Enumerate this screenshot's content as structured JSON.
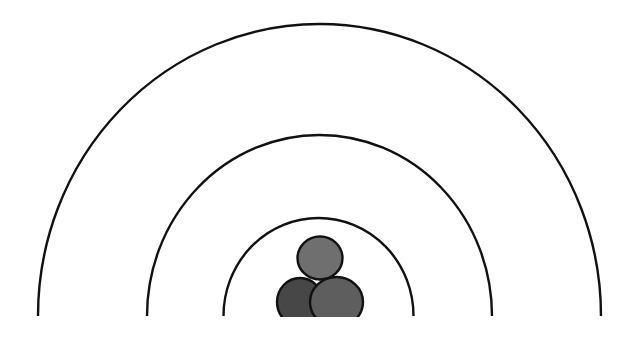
{
  "diagram": {
    "background": "#ffffff",
    "arcs": [
      {
        "name": "inner-arc",
        "cx": 318.5,
        "baseline_y": 316,
        "rx": 95,
        "ry": 98,
        "stroke": "#111111",
        "stroke_width": 2.4
      },
      {
        "name": "middle-arc",
        "cx": 319.5,
        "baseline_y": 316,
        "rx": 172.5,
        "ry": 181,
        "stroke": "#111111",
        "stroke_width": 2.4
      },
      {
        "name": "outer-arc",
        "cx": 319.5,
        "baseline_y": 316,
        "rx": 281.5,
        "ry": 292,
        "stroke": "#111111",
        "stroke_width": 2.4
      }
    ],
    "people_icon": {
      "head": {
        "cx": 320,
        "cy": 258,
        "rx": 22.5,
        "ry": 21.5,
        "fill": "#6f6f6f"
      },
      "left_body": {
        "cx": 300,
        "cy": 302,
        "rx": 23,
        "ry": 24,
        "fill": "#474747"
      },
      "right_body": {
        "cx": 336.5,
        "cy": 302,
        "rx": 26.5,
        "ry": 25,
        "fill": "#5e5e5e"
      },
      "outline": "#111111",
      "cut_y": 317
    }
  }
}
